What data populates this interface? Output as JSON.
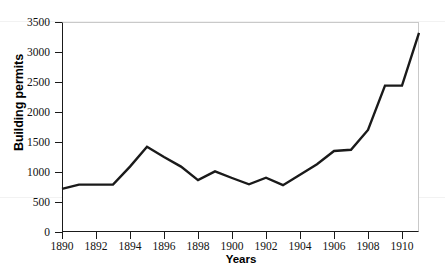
{
  "chart_data": {
    "type": "line",
    "title": "",
    "xlabel": "Years",
    "ylabel": "Building permits",
    "xlim": [
      1890,
      1911
    ],
    "ylim": [
      0,
      3500
    ],
    "grid": false,
    "legend": null,
    "x": [
      1890,
      1891,
      1892,
      1893,
      1894,
      1895,
      1896,
      1897,
      1898,
      1899,
      1900,
      1901,
      1902,
      1903,
      1904,
      1905,
      1906,
      1907,
      1908,
      1909,
      1910,
      1911
    ],
    "values": [
      720,
      790,
      790,
      790,
      1090,
      1420,
      1250,
      1090,
      865,
      1010,
      900,
      795,
      905,
      780,
      955,
      1130,
      1350,
      1370,
      1700,
      2440,
      2440,
      3320
    ],
    "series": [
      {
        "name": "Building permits",
        "color": "#1a1a1a",
        "values": [
          720,
          790,
          790,
          790,
          1090,
          1420,
          1250,
          1090,
          865,
          1010,
          900,
          795,
          905,
          780,
          955,
          1130,
          1350,
          1370,
          1700,
          2440,
          2440,
          3320
        ]
      }
    ],
    "y_ticks": [
      0,
      500,
      1000,
      1500,
      2000,
      2500,
      3000,
      3500
    ],
    "y_tick_labels": [
      "0",
      "500",
      "1000",
      "1500",
      "2000",
      "2500",
      "3000",
      "3500"
    ],
    "x_ticks": [
      1890,
      1892,
      1894,
      1896,
      1898,
      1900,
      1902,
      1904,
      1906,
      1908,
      1910
    ],
    "x_tick_labels": [
      "1890",
      "1892",
      "1894",
      "1896",
      "1898",
      "1900",
      "1902",
      "1904",
      "1906",
      "1908",
      "1910"
    ]
  },
  "colors": {
    "line": "#1a1a1a",
    "axis": "#1a1a1a",
    "frame": "#c9c9c9",
    "background": "#ffffff",
    "text": "#111111"
  }
}
